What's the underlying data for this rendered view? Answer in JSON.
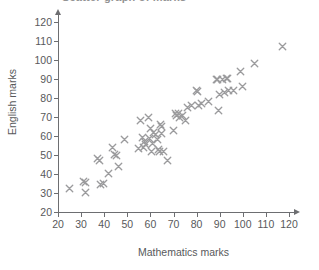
{
  "figure": {
    "title_sliver": "Scatter graph of marks",
    "x_axis_label": "Mathematics marks",
    "y_axis_label": "English marks",
    "marker_color": "#9b9b9d",
    "axis_color": "#6d6e71",
    "background": "#ffffff"
  },
  "chart_data": {
    "type": "scatter",
    "title": "Scatter graph of marks",
    "xlabel": "Mathematics marks",
    "ylabel": "English marks",
    "xlim": [
      20,
      120
    ],
    "ylim": [
      20,
      120
    ],
    "xticks": [
      20,
      30,
      40,
      50,
      60,
      70,
      80,
      90,
      100,
      110,
      120
    ],
    "yticks": [
      20,
      30,
      40,
      50,
      60,
      70,
      80,
      90,
      100,
      110,
      120
    ],
    "grid": false,
    "legend": null,
    "marker": "x",
    "marker_color": "#9b9b9d",
    "n_points": 62,
    "series": [
      {
        "name": "Students",
        "points": [
          [
            25,
            32.5
          ],
          [
            31,
            36
          ],
          [
            32,
            30.5
          ],
          [
            32,
            35.5
          ],
          [
            37,
            48
          ],
          [
            38,
            47
          ],
          [
            38.5,
            34.5
          ],
          [
            39.5,
            35
          ],
          [
            42,
            40.5
          ],
          [
            43.5,
            54
          ],
          [
            44.5,
            50.5
          ],
          [
            45.5,
            50
          ],
          [
            46,
            44
          ],
          [
            49,
            58
          ],
          [
            55,
            53.5
          ],
          [
            55.5,
            68
          ],
          [
            56.5,
            59
          ],
          [
            57,
            54
          ],
          [
            57.5,
            57
          ],
          [
            58,
            55.5
          ],
          [
            59,
            70
          ],
          [
            59.5,
            58.5
          ],
          [
            60,
            64
          ],
          [
            60.5,
            52
          ],
          [
            61,
            56
          ],
          [
            61.5,
            62
          ],
          [
            62,
            61
          ],
          [
            63,
            58
          ],
          [
            63.5,
            53
          ],
          [
            64,
            52
          ],
          [
            64.5,
            66
          ],
          [
            65,
            65
          ],
          [
            65,
            61.5
          ],
          [
            65.5,
            52
          ],
          [
            67.5,
            47
          ],
          [
            70,
            63
          ],
          [
            71,
            72
          ],
          [
            71.5,
            71
          ],
          [
            72,
            72
          ],
          [
            72.5,
            70
          ],
          [
            74,
            71
          ],
          [
            75,
            68
          ],
          [
            76,
            75
          ],
          [
            78,
            76
          ],
          [
            80,
            84
          ],
          [
            80.5,
            83.5
          ],
          [
            81,
            76
          ],
          [
            82,
            77
          ],
          [
            85,
            78
          ],
          [
            88.5,
            90
          ],
          [
            89,
            89.5
          ],
          [
            89.5,
            73.5
          ],
          [
            90,
            82
          ],
          [
            91,
            90
          ],
          [
            92,
            83
          ],
          [
            93,
            90.5
          ],
          [
            93.5,
            90.5
          ],
          [
            94,
            84
          ],
          [
            96,
            84
          ],
          [
            99,
            94
          ],
          [
            100,
            86
          ],
          [
            105,
            98
          ],
          [
            117,
            107
          ]
        ]
      }
    ]
  }
}
